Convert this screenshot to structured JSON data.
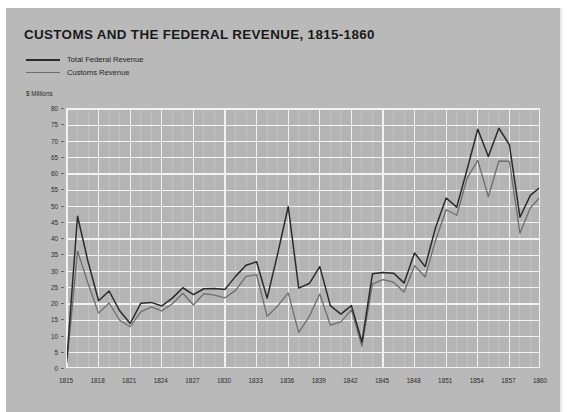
{
  "title": "CUSTOMS AND THE FEDERAL REVENUE, 1815-1860",
  "axis_unit_label": "$ Millions",
  "legend": {
    "items": [
      {
        "label": "Total Federal Revenue",
        "color": "#2b2b2b"
      },
      {
        "label": "Customs Revenue",
        "color": "#6e6e6e"
      }
    ]
  },
  "colors": {
    "page_background": "#ffffff",
    "paper_background": "#b9b9b9",
    "plot_background": "#b4b4b4",
    "gridline_major": "#f2f2f2",
    "gridline_minor": "#c6c6c6",
    "total_federal_revenue": "#2b2b2b",
    "customs_revenue": "#6e6e6e",
    "text": "#2d2d2d"
  },
  "chart_data": {
    "type": "line",
    "title": "CUSTOMS AND THE FEDERAL REVENUE, 1815-1860",
    "xlabel": "",
    "ylabel": "$ Millions",
    "ylim": [
      0,
      80
    ],
    "xlim": [
      1815,
      1860
    ],
    "ytick_step": 5,
    "yticks": [
      0,
      5,
      10,
      15,
      20,
      25,
      30,
      35,
      40,
      45,
      50,
      55,
      60,
      65,
      70,
      75,
      80
    ],
    "xticks": [
      1815,
      1818,
      1821,
      1824,
      1827,
      1830,
      1833,
      1836,
      1839,
      1842,
      1845,
      1848,
      1851,
      1854,
      1857,
      1860
    ],
    "xtick_labels": [
      "1815",
      "1818",
      "1821",
      "1824",
      "1827",
      "1830",
      "1833",
      "1836",
      "1839",
      "1842",
      "1845",
      "1848",
      "1851",
      "1854",
      "1857",
      "1860"
    ],
    "grid": true,
    "legend_position": "above-plot-left",
    "x": [
      1815,
      1816,
      1817,
      1818,
      1819,
      1820,
      1821,
      1822,
      1823,
      1824,
      1825,
      1826,
      1827,
      1828,
      1829,
      1830,
      1831,
      1832,
      1833,
      1834,
      1835,
      1836,
      1837,
      1838,
      1839,
      1840,
      1841,
      1842,
      1843,
      1844,
      1845,
      1846,
      1847,
      1848,
      1849,
      1850,
      1851,
      1852,
      1853,
      1854,
      1855,
      1856,
      1857,
      1858,
      1859,
      1860
    ],
    "series": [
      {
        "name": "Total Federal Revenue",
        "color": "#2b2b2b",
        "values": [
          3.5,
          47.0,
          33.0,
          21.0,
          24.0,
          17.9,
          14.0,
          20.2,
          20.5,
          19.4,
          21.8,
          25.0,
          22.9,
          24.7,
          24.8,
          24.5,
          28.5,
          31.9,
          33.0,
          21.8,
          35.4,
          50.0,
          24.9,
          26.3,
          31.5,
          19.5,
          16.9,
          19.5,
          8.3,
          29.3,
          29.7,
          29.5,
          26.5,
          35.7,
          31.5,
          43.6,
          52.6,
          49.8,
          61.6,
          73.8,
          65.4,
          74.1,
          69.0,
          46.7,
          53.5,
          56.1
        ]
      },
      {
        "name": "Customs Revenue",
        "color": "#6e6e6e",
        "values": [
          2.0,
          36.3,
          26.3,
          17.2,
          20.3,
          15.0,
          13.0,
          17.6,
          19.1,
          17.9,
          20.1,
          23.3,
          19.7,
          23.2,
          22.7,
          21.9,
          24.2,
          28.5,
          29.0,
          16.2,
          19.4,
          23.4,
          11.2,
          16.2,
          23.1,
          13.5,
          14.5,
          18.2,
          7.0,
          26.2,
          27.5,
          26.7,
          23.7,
          31.8,
          28.3,
          39.7,
          49.0,
          47.3,
          58.9,
          64.2,
          53.0,
          64.0,
          63.9,
          41.8,
          49.6,
          53.2
        ]
      }
    ]
  }
}
